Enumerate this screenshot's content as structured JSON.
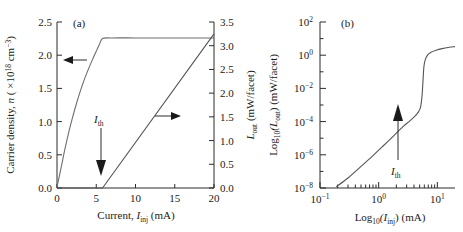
{
  "figure": {
    "panel_a_label": "(a)",
    "panel_b_label": "(b)"
  },
  "panel_a": {
    "xlabel_main": "Current, ",
    "xlabel_sym": "I",
    "xlabel_sub": "inj",
    "xlabel_unit": " (mA)",
    "ylabel_left_main": "Carrier density, ",
    "ylabel_left_sym": "n",
    "ylabel_left_unit_open": " ( ×10",
    "ylabel_left_unit_sup1": "18",
    "ylabel_left_unit_mid": " cm",
    "ylabel_left_unit_sup2": "−3",
    "ylabel_left_unit_close": ")",
    "ylabel_right_sym": "L",
    "ylabel_right_sub": "out",
    "ylabel_right_unit": " (mW/facet)",
    "xticks": [
      "0",
      "5",
      "10",
      "15",
      "20"
    ],
    "xtick_values": [
      0,
      5,
      10,
      15,
      20
    ],
    "yticks_left": [
      "0.0",
      "0.5",
      "1.0",
      "1.5",
      "2.0",
      "2.5"
    ],
    "ytick_left_values": [
      0.0,
      0.5,
      1.0,
      1.5,
      2.0,
      2.5
    ],
    "yticks_right": [
      "0.0",
      "0.5",
      "1.0",
      "1.5",
      "2.0",
      "2.5",
      "3.0",
      "3.5"
    ],
    "ytick_right_values": [
      0.0,
      0.5,
      1.0,
      1.5,
      2.0,
      2.5,
      3.0,
      3.5
    ],
    "threshold_label_sym": "I",
    "threshold_label_sub": "th",
    "threshold_value": 5.8
  },
  "panel_b": {
    "xlabel_main": "Log",
    "xlabel_main_sub": "10",
    "xlabel_sym": "(I",
    "xlabel_sym_sub": "inj",
    "xlabel_close": ") (mA)",
    "ylabel_main": "Log",
    "ylabel_main_sub": "10",
    "ylabel_sym": "(L",
    "ylabel_sym_sub": "out",
    "ylabel_close": ") (mW/facet)",
    "xticks": [
      "10",
      "10",
      "10"
    ],
    "xtick_exps": [
      "−1",
      "0",
      "1"
    ],
    "xtick_values": [
      -1,
      0,
      1
    ],
    "yticks": [
      "10",
      "10",
      "10",
      "10",
      "10",
      "10"
    ],
    "ytick_exps": [
      "2",
      "0",
      "−2",
      "−4",
      "−6",
      "−8"
    ],
    "ytick_values": [
      2,
      0,
      -2,
      -4,
      -6,
      -8
    ],
    "threshold_label_sym": "I",
    "threshold_label_sub": "th",
    "threshold_value": 5.8
  },
  "chart_data": [
    {
      "type": "line",
      "panel": "(a)",
      "title": "",
      "xlabel": "Current, I_inj (mA)",
      "ylabel": "Carrier density, n (×10^18 cm^-3)",
      "ylabel_right": "L_out (mW/facet)",
      "xlim": [
        0,
        20
      ],
      "ylim": [
        0,
        2.5
      ],
      "ylim_right": [
        0,
        3.5
      ],
      "grid": false,
      "legend": "none",
      "annotations": [
        {
          "text": "I_th",
          "x": 5.8,
          "note": "down arrow marking threshold current"
        },
        {
          "text": "left-arrow",
          "note": "points to left axis for carrier density curve"
        },
        {
          "text": "right-arrow",
          "note": "points to right axis for light output curve"
        }
      ],
      "series": [
        {
          "name": "Carrier density n",
          "axis": "left",
          "x": [
            0.0,
            0.3,
            0.6,
            1.0,
            1.5,
            2.0,
            2.5,
            3.0,
            3.5,
            4.0,
            4.5,
            5.0,
            5.4,
            5.8,
            7.0,
            10.0,
            13.0,
            16.0,
            20.0
          ],
          "y": [
            0.02,
            0.18,
            0.35,
            0.58,
            0.84,
            1.07,
            1.28,
            1.47,
            1.64,
            1.79,
            1.93,
            2.06,
            2.16,
            2.25,
            2.26,
            2.26,
            2.26,
            2.26,
            2.26
          ]
        },
        {
          "name": "Light output L_out",
          "axis": "right",
          "x": [
            0.0,
            5.8,
            20.0
          ],
          "y": [
            0.0,
            0.0,
            3.25
          ]
        }
      ]
    },
    {
      "type": "line",
      "panel": "(b)",
      "title": "",
      "xlabel": "Log10(I_inj) (mA)",
      "ylabel": "Log10(L_out) (mW/facet)",
      "xlim": [
        0.1,
        20
      ],
      "ylim": [
        1e-08,
        100
      ],
      "xscale": "log",
      "yscale": "log",
      "grid": false,
      "legend": "none",
      "annotations": [
        {
          "text": "I_th",
          "x": 5.8,
          "note": "up arrow marking threshold current"
        }
      ],
      "series": [
        {
          "name": "Light output L_out",
          "x": [
            0.19,
            0.3,
            0.5,
            0.8,
            1.2,
            1.8,
            2.6,
            3.4,
            4.2,
            4.8,
            5.2,
            5.5,
            5.7,
            5.9,
            6.2,
            6.8,
            7.8,
            9.5,
            12.0,
            16.0,
            20.0
          ],
          "y": [
            1.2e-08,
            4e-08,
            2e-07,
            9e-07,
            3.5e-06,
            1.4e-05,
            5e-05,
            0.00011,
            0.00022,
            0.0004,
            0.0008,
            0.004,
            0.03,
            0.2,
            0.5,
            1.0,
            1.5,
            2.0,
            2.5,
            3.0,
            3.3
          ]
        }
      ]
    }
  ]
}
